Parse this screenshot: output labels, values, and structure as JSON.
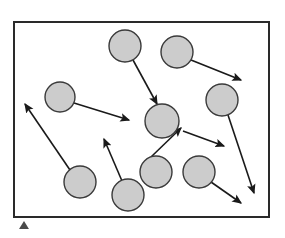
{
  "figure": {
    "canvas": {
      "width": 285,
      "height": 238
    },
    "colors": {
      "background": "#ffffff",
      "box_border": "#2a2a2a",
      "circle_fill": "#cccccc",
      "circle_stroke": "#3a3a3a",
      "arrow": "#1a1a1a",
      "marker": "#4a4a4a"
    },
    "box": {
      "label": "container-boundary",
      "x": 14,
      "y": 22,
      "width": 255,
      "height": 195,
      "stroke_width": 2
    },
    "circles": [
      {
        "id": "particle-1",
        "cx": 125,
        "cy": 46,
        "r": 16
      },
      {
        "id": "particle-2",
        "cx": 177,
        "cy": 52,
        "r": 16
      },
      {
        "id": "particle-3",
        "cx": 60,
        "cy": 97,
        "r": 15
      },
      {
        "id": "particle-4",
        "cx": 222,
        "cy": 100,
        "r": 16
      },
      {
        "id": "particle-5",
        "cx": 162,
        "cy": 121,
        "r": 17
      },
      {
        "id": "particle-6",
        "cx": 156,
        "cy": 172,
        "r": 16
      },
      {
        "id": "particle-7",
        "cx": 199,
        "cy": 172,
        "r": 16
      },
      {
        "id": "particle-8",
        "cx": 80,
        "cy": 182,
        "r": 16
      },
      {
        "id": "particle-9",
        "cx": 128,
        "cy": 195,
        "r": 16
      },
      {
        "id": "particle-10",
        "cx": 241,
        "cy": 46,
        "r": 0
      }
    ],
    "arrows": [
      {
        "id": "vector-1",
        "from_particle": "particle-1",
        "x1": 133,
        "y1": 60,
        "x2": 157,
        "y2": 104
      },
      {
        "id": "vector-2",
        "from_particle": "particle-2",
        "x1": 191,
        "y1": 60,
        "x2": 241,
        "y2": 80
      },
      {
        "id": "vector-3",
        "from_particle": "particle-3",
        "x1": 74,
        "y1": 103,
        "x2": 129,
        "y2": 120
      },
      {
        "id": "vector-4",
        "from_particle": "particle-4",
        "x1": 228,
        "y1": 115,
        "x2": 254,
        "y2": 193
      },
      {
        "id": "vector-5",
        "from_particle": "particle-5",
        "x1": 183,
        "y1": 131,
        "x2": 224,
        "y2": 146
      },
      {
        "id": "vector-6",
        "from_particle": "particle-6",
        "x1": 151,
        "y1": 157,
        "x2": 181,
        "y2": 128
      },
      {
        "id": "vector-7",
        "from_particle": "particle-7",
        "x1": 211,
        "y1": 182,
        "x2": 241,
        "y2": 203
      },
      {
        "id": "vector-8",
        "from_particle": "particle-8",
        "x1": 70,
        "y1": 170,
        "x2": 25,
        "y2": 104
      },
      {
        "id": "vector-9",
        "from_particle": "particle-9",
        "x1": 122,
        "y1": 181,
        "x2": 104,
        "y2": 139
      },
      {
        "id": "vector-10",
        "from_particle": "particle-10",
        "x1": 0,
        "y1": 0,
        "x2": 0,
        "y2": 0
      }
    ],
    "marker": {
      "id": "corner-marker",
      "x": 24,
      "y": 229,
      "size": 8
    }
  }
}
